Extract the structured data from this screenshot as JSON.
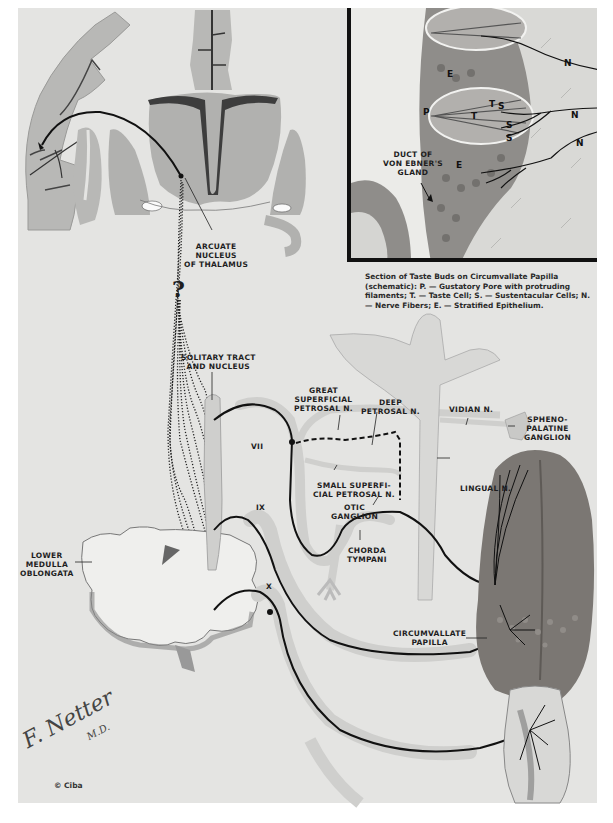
{
  "figure": {
    "colors": {
      "background": "#ffffff",
      "plate": "#e4e4e2",
      "brain_gray": "#b3b3b1",
      "nerve_sheath": "#cfcfcd",
      "nerve_fiber": "#111111",
      "tongue": "#7a7672"
    }
  },
  "brain_section": {
    "labels": {
      "arcuate_nucleus": "ARCUATE\nNUCLEUS\nOF THALAMUS"
    }
  },
  "inset": {
    "letters": {
      "p": "P",
      "e_upper": "E",
      "e_lower": "E",
      "t1": "T",
      "t2": "T",
      "s1": "S",
      "s2": "S",
      "s3": "S",
      "n1": "N",
      "n2": "N",
      "n3": "N"
    },
    "duct_label": "DUCT OF\nVON EBNER'S\nGLAND",
    "caption": "Section of Taste Buds on Circumvallate Papilla (schematic): P. — Gustatory Pore with protruding filaments; T. — Taste Cell; S. — Sustentacular Cells; N. — Nerve Fibers; E. — Stratified Epithelium."
  },
  "pathway_labels": {
    "solitary_tract": "SOLITARY TRACT\nAND NUCLEUS",
    "great_superficial_petrosal": "GREAT\nSUPERFICIAL\nPETROSAL N.",
    "deep_petrosal": "DEEP\nPETROSAL N.",
    "vidian": "VIDIAN N.",
    "sphenopalatine": "SPHENO-\nPALATINE\nGANGLION",
    "vii": "VII",
    "small_superficial_petrosal": "SMALL SUPERFI-\nCIAL PETROSAL N.",
    "otic_ganglion": "OTIC\nGANGLION",
    "lingual": "LINGUAL N.",
    "ix": "IX",
    "chorda_tympani": "CHORDA\nTYMPANI",
    "lower_medulla": "LOWER\nMEDULLA\nOBLONGATA",
    "x": "X",
    "circumvallate_papilla": "CIRCUMVALLATE\nPAPILLA",
    "question_mark": "?"
  },
  "credits": {
    "signature": "F. Netter",
    "signature_suffix": "M.D.",
    "copyright": "© Ciba"
  }
}
